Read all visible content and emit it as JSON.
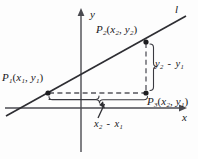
{
  "figure": {
    "colors": {
      "stroke": "#2e2e33",
      "axis": "#4a4a50",
      "dashed": "#55555c",
      "background": "#fdfdfd"
    },
    "axes": {
      "x_label": "x",
      "y_label": "y",
      "x_axis_y": 108,
      "y_axis_x": 81
    },
    "line": {
      "label": "l",
      "x1": 6,
      "y1": 116,
      "x2": 186,
      "y2": 16
    },
    "points": [
      {
        "id": "P1",
        "name": "P",
        "index": "1",
        "coord_x": "x",
        "coord_x_index": "1",
        "coord_y": "y",
        "coord_y_index": "1",
        "label": "P1(x1, y1)",
        "px": 48,
        "py": 93
      },
      {
        "id": "P2",
        "name": "P",
        "index": "2",
        "coord_x": "x",
        "coord_x_index": "2",
        "coord_y": "y",
        "coord_y_index": "2",
        "label": "P2(x2, y2)",
        "px": 146,
        "py": 42
      },
      {
        "id": "P3",
        "name": "P",
        "index": "3",
        "coord_x": "x",
        "coord_x_index": "2",
        "coord_y": "y",
        "coord_y_index": "1",
        "label": "P3(x2, y1)",
        "px": 146,
        "py": 93
      }
    ],
    "annotations": {
      "rise": {
        "text": "y2 - y1",
        "var": "y",
        "sub_a": "2",
        "sub_b": "1",
        "operator": "-"
      },
      "run": {
        "text": "x2 - x1",
        "var": "x",
        "sub_a": "2",
        "sub_b": "1",
        "operator": "-"
      }
    }
  }
}
